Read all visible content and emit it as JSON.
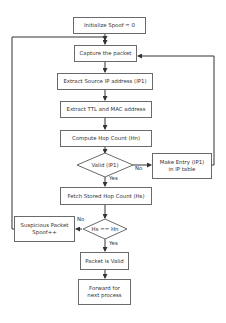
{
  "diagram": {
    "type": "flowchart",
    "nodes": {
      "init": "Initialize Spoof = 0",
      "capture": "Capture the packet",
      "extract_ip": "Extract Source IP address (IP1)",
      "extract_ttl": "Extract TTL and MAC address",
      "compute_hop": "Compute Hop Count (Hn)",
      "valid_decision": "Valid (IP1)",
      "make_entry_line1": "Make Entry (IP1)",
      "make_entry_line2": "in IP table",
      "fetch_hop": "Fetch Stored Hop Count (Hs)",
      "compare_decision": "Hs == Hn",
      "suspicious_line1": "Suspicious Packet",
      "suspicious_line2": "Spoof++",
      "packet_valid": "Packet is Valid",
      "forward_line1": "Forward for",
      "forward_line2": "next process"
    },
    "edge_labels": {
      "valid_no": "No",
      "valid_yes": "Yes",
      "compare_no": "No",
      "compare_yes": "Yes"
    },
    "colors": {
      "line": "#333333",
      "border": "#6a6a6a",
      "text": "#333333",
      "background": "#ffffff"
    }
  }
}
